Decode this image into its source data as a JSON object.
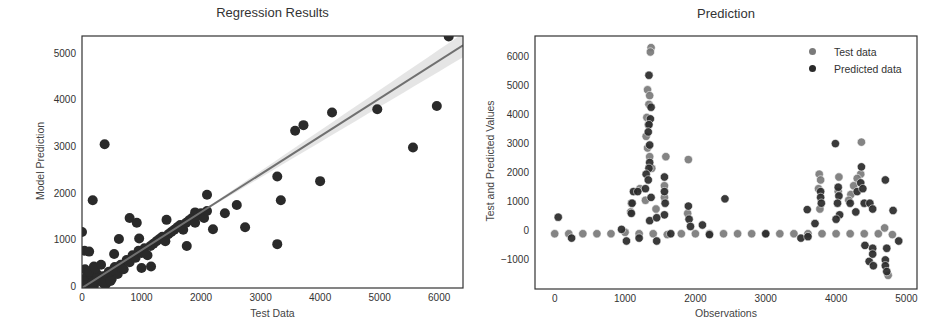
{
  "chart_data": [
    {
      "type": "scatter",
      "title": "Regression Results",
      "xlabel": "Test Data",
      "ylabel": "Model Prediction",
      "xlim": [
        0,
        6400
      ],
      "ylim": [
        0,
        5400
      ],
      "xticks": [
        "0",
        "1000",
        "2000",
        "3000",
        "4000",
        "5000",
        "6000"
      ],
      "yticks": [
        "0",
        "1000",
        "2000",
        "3000",
        "4000",
        "5000"
      ],
      "grid": false,
      "regression_line": {
        "x": [
          0,
          6400
        ],
        "y": [
          0,
          5200
        ],
        "color": "#707070",
        "ci_band": true
      },
      "points": [
        [
          0,
          1200
        ],
        [
          40,
          800
        ],
        [
          120,
          780
        ],
        [
          180,
          1880
        ],
        [
          200,
          460
        ],
        [
          380,
          3080
        ],
        [
          540,
          730
        ],
        [
          620,
          1050
        ],
        [
          800,
          1500
        ],
        [
          920,
          1400
        ],
        [
          960,
          1060
        ],
        [
          1000,
          430
        ],
        [
          1160,
          460
        ],
        [
          1420,
          1460
        ],
        [
          1760,
          900
        ],
        [
          1900,
          1620
        ],
        [
          2100,
          2000
        ],
        [
          2200,
          1260
        ],
        [
          2400,
          1600
        ],
        [
          2600,
          1780
        ],
        [
          2740,
          1300
        ],
        [
          3280,
          2390
        ],
        [
          3280,
          940
        ],
        [
          3340,
          1880
        ],
        [
          3580,
          3370
        ],
        [
          3720,
          3490
        ],
        [
          4000,
          2290
        ],
        [
          4200,
          3760
        ],
        [
          4960,
          3830
        ],
        [
          5560,
          3010
        ],
        [
          5960,
          3900
        ],
        [
          6160,
          5390
        ],
        [
          7800,
          3680
        ],
        [
          7960,
          4330
        ],
        [
          100,
          100
        ],
        [
          150,
          200
        ],
        [
          200,
          50
        ],
        [
          250,
          300
        ],
        [
          300,
          150
        ],
        [
          350,
          250
        ],
        [
          400,
          80
        ],
        [
          450,
          350
        ],
        [
          500,
          200
        ],
        [
          550,
          450
        ],
        [
          600,
          300
        ],
        [
          650,
          500
        ],
        [
          700,
          400
        ],
        [
          750,
          600
        ],
        [
          800,
          550
        ],
        [
          850,
          700
        ],
        [
          900,
          650
        ],
        [
          950,
          800
        ],
        [
          1000,
          750
        ],
        [
          1050,
          850
        ],
        [
          1100,
          700
        ],
        [
          1150,
          900
        ],
        [
          1200,
          950
        ],
        [
          1250,
          1000
        ],
        [
          1300,
          1050
        ],
        [
          1350,
          1100
        ],
        [
          1400,
          1000
        ],
        [
          1450,
          1150
        ],
        [
          1500,
          1200
        ],
        [
          1550,
          1250
        ],
        [
          1600,
          1300
        ],
        [
          1650,
          1350
        ],
        [
          1700,
          1250
        ],
        [
          1750,
          1400
        ],
        [
          1800,
          1450
        ],
        [
          1850,
          1500
        ],
        [
          1900,
          1400
        ],
        [
          1950,
          1550
        ],
        [
          2000,
          1600
        ],
        [
          2050,
          1500
        ],
        [
          2100,
          1650
        ],
        [
          50,
          400
        ],
        [
          80,
          250
        ],
        [
          30,
          150
        ],
        [
          60,
          50
        ],
        [
          120,
          350
        ],
        [
          180,
          120
        ],
        [
          220,
          420
        ],
        [
          260,
          200
        ],
        [
          320,
          500
        ],
        [
          360,
          100
        ],
        [
          420,
          280
        ],
        [
          480,
          150
        ],
        [
          520,
          380
        ]
      ]
    },
    {
      "type": "scatter",
      "title": "Prediction",
      "xlabel": "Observations",
      "ylabel": "Test and Predicted Values",
      "xlim": [
        -280,
        5150
      ],
      "ylim": [
        -1950,
        6750
      ],
      "xticks": [
        "0",
        "1000",
        "2000",
        "3000",
        "4000",
        "5000"
      ],
      "yticks": [
        "-1000",
        "0",
        "1000",
        "2000",
        "3000",
        "4000",
        "5000",
        "6000"
      ],
      "grid": false,
      "legend": {
        "position": "upper right",
        "entries": [
          "Test data",
          "Predicted data"
        ]
      },
      "series": [
        {
          "name": "Test data",
          "color": "#7a7a7a",
          "points": [
            [
              1370,
              6350
            ],
            [
              1360,
              6200
            ],
            [
              1320,
              4900
            ],
            [
              1350,
              4700
            ],
            [
              1340,
              4400
            ],
            [
              1310,
              3950
            ],
            [
              1330,
              3700
            ],
            [
              1300,
              3300
            ],
            [
              1320,
              2900
            ],
            [
              1350,
              2600
            ],
            [
              1580,
              2600
            ],
            [
              1900,
              2500
            ],
            [
              1380,
              2200
            ],
            [
              1290,
              1100
            ],
            [
              1560,
              1600
            ],
            [
              1560,
              1200
            ],
            [
              1090,
              1000
            ],
            [
              1080,
              700
            ],
            [
              1210,
              1500
            ],
            [
              1440,
              800
            ],
            [
              1890,
              650
            ],
            [
              3760,
              2000
            ],
            [
              3780,
              1800
            ],
            [
              3750,
              1500
            ],
            [
              3770,
              800
            ],
            [
              4040,
              1900
            ],
            [
              4030,
              1400
            ],
            [
              4360,
              3100
            ],
            [
              4350,
              2000
            ],
            [
              4300,
              1850
            ],
            [
              4250,
              1600
            ],
            [
              4210,
              1300
            ],
            [
              4180,
              1100
            ],
            [
              4690,
              150
            ],
            [
              0,
              -50
            ],
            [
              200,
              -50
            ],
            [
              400,
              -50
            ],
            [
              600,
              -50
            ],
            [
              800,
              -50
            ],
            [
              1000,
              0
            ],
            [
              1200,
              -50
            ],
            [
              1400,
              -50
            ],
            [
              1600,
              -80
            ],
            [
              1800,
              -50
            ],
            [
              2000,
              -50
            ],
            [
              2200,
              -50
            ],
            [
              2400,
              -50
            ],
            [
              2600,
              -50
            ],
            [
              2800,
              -50
            ],
            [
              3000,
              -50
            ],
            [
              3200,
              -50
            ],
            [
              3400,
              -50
            ],
            [
              3600,
              -50
            ],
            [
              3800,
              -50
            ],
            [
              4000,
              -50
            ],
            [
              4200,
              -50
            ],
            [
              4400,
              -50
            ],
            [
              4600,
              -50
            ],
            [
              4800,
              -80
            ],
            [
              4740,
              -1480
            ]
          ]
        },
        {
          "name": "Predicted data",
          "color": "#2a2a2a",
          "points": [
            [
              50,
              520
            ],
            [
              1340,
              5400
            ],
            [
              1370,
              4300
            ],
            [
              1360,
              3900
            ],
            [
              1340,
              3700
            ],
            [
              1330,
              3450
            ],
            [
              1350,
              3000
            ],
            [
              1350,
              2400
            ],
            [
              1340,
              2200
            ],
            [
              1300,
              2000
            ],
            [
              1330,
              1800
            ],
            [
              1290,
              1500
            ],
            [
              1370,
              1200
            ],
            [
              1350,
              400
            ],
            [
              1120,
              1400
            ],
            [
              1180,
              1400
            ],
            [
              1100,
              1000
            ],
            [
              1090,
              650
            ],
            [
              1560,
              1900
            ],
            [
              1560,
              1400
            ],
            [
              1570,
              1000
            ],
            [
              1560,
              600
            ],
            [
              1450,
              500
            ],
            [
              1900,
              900
            ],
            [
              1910,
              450
            ],
            [
              1930,
              200
            ],
            [
              2100,
              250
            ],
            [
              2420,
              1150
            ],
            [
              3590,
              780
            ],
            [
              3700,
              300
            ],
            [
              3780,
              1400
            ],
            [
              3780,
              1200
            ],
            [
              3790,
              1000
            ],
            [
              3990,
              3050
            ],
            [
              4030,
              1550
            ],
            [
              4040,
              1250
            ],
            [
              4020,
              1000
            ],
            [
              4050,
              600
            ],
            [
              4000,
              450
            ],
            [
              4360,
              2250
            ],
            [
              4350,
              1700
            ],
            [
              4300,
              1400
            ],
            [
              4380,
              1500
            ],
            [
              4200,
              1000
            ],
            [
              4280,
              700
            ],
            [
              4400,
              1000
            ],
            [
              4480,
              1000
            ],
            [
              4520,
              800
            ],
            [
              4410,
              -450
            ],
            [
              4470,
              -1000
            ],
            [
              4520,
              -550
            ],
            [
              4520,
              -750
            ],
            [
              4530,
              -1150
            ],
            [
              4700,
              1800
            ],
            [
              4720,
              -550
            ],
            [
              4700,
              -950
            ],
            [
              4700,
              -1150
            ],
            [
              4720,
              -1350
            ],
            [
              4810,
              750
            ],
            [
              4890,
              -300
            ],
            [
              3500,
              -200
            ],
            [
              3600,
              -150
            ],
            [
              1020,
              -300
            ],
            [
              1200,
              -200
            ],
            [
              1450,
              -300
            ],
            [
              240,
              -200
            ],
            [
              950,
              100
            ],
            [
              1650,
              -50
            ],
            [
              2200,
              -80
            ],
            [
              3000,
              -50
            ]
          ]
        }
      ]
    }
  ],
  "left_chart": {
    "title": "Regression Results",
    "xlabel": "Test Data",
    "ylabel": "Model Prediction",
    "xticks": [
      "0",
      "1000",
      "2000",
      "3000",
      "4000",
      "5000",
      "6000"
    ],
    "yticks": [
      "0",
      "1000",
      "2000",
      "3000",
      "4000",
      "5000"
    ]
  },
  "right_chart": {
    "title": "Prediction",
    "xlabel": "Observations",
    "ylabel": "Test and Predicted Values",
    "xticks": [
      "0",
      "1000",
      "2000",
      "3000",
      "4000",
      "5000"
    ],
    "yticks": [
      "-1000",
      "0",
      "1000",
      "2000",
      "3000",
      "4000",
      "5000",
      "6000"
    ],
    "legend": [
      {
        "label": "Test data",
        "color": "#7a7a7a"
      },
      {
        "label": "Predicted data",
        "color": "#2a2a2a"
      }
    ]
  }
}
